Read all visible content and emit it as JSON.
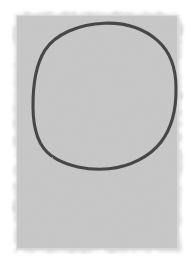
{
  "image": {
    "kind": "hand-drawn-sketch",
    "title": "Hand-drawn circle on gray paper",
    "width": 195,
    "height": 269,
    "background_color": "#ffffff"
  },
  "paper": {
    "label": "gray paper patch",
    "fill_color": "#c9c9c9",
    "edge_fade_color": "#ffffff",
    "x": 14,
    "y": 13,
    "width": 167,
    "height": 239,
    "texture": "grainy",
    "edge_style": "ragged-soft"
  },
  "drawing": {
    "label": "circle outline",
    "shape": "circle",
    "stroke_color": "#474747",
    "stroke_width": 3.1,
    "fill": "none",
    "center_x": 104.5,
    "center_y": 96.0,
    "radius_x": 71.5,
    "radius_y": 73.0,
    "left_extent": 33,
    "right_extent": 176,
    "top_extent": 23,
    "bottom_extent": 169,
    "hand_drawn": true,
    "path": "M 104.5 23.2 C 124.0 22.6 143.5 28.2 157.6 40.6 C 170.4 51.9 176.0 69.4 176.0 88.0 C 176.3 107.0 172.6 126.8 161.2 141.8 C 149.8 156.8 129.6 166.8 109.0 168.8 C 88.5 170.8 66.0 166.2 51.0 155.4 C 36.6 145.0 33.2 126.0 33.0 107.5 C 32.8 88.0 35.0 66.0 45.0 50.2 C 55.2 34.2 79.0 24.0 104.5 23.2 Z"
  }
}
